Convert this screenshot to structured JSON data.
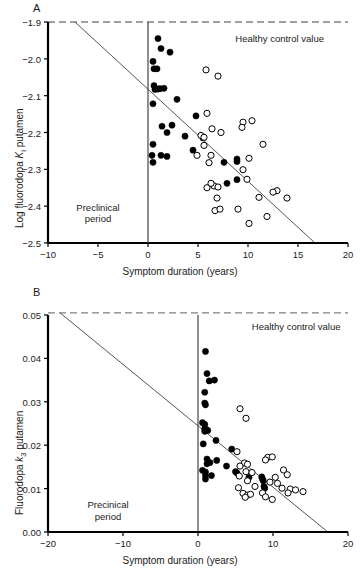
{
  "figure": {
    "xlabel": "Symptom duration (years)"
  },
  "chart_data": [
    {
      "id": "panel-a",
      "type": "scatter",
      "panel_label": "A",
      "title": "",
      "xlabel": "Symptom duration (years)",
      "ylabel": "Log fluorodopa Ki putamen",
      "ylabel_prefix": "Log fluorodopa ",
      "ylabel_symbol": "K",
      "ylabel_sub": "i",
      "ylabel_suffix": " putamen",
      "xlim": [
        -10,
        20
      ],
      "ylim": [
        -2.5,
        -1.9
      ],
      "xticks": [
        -10,
        -5,
        0,
        5,
        10,
        15,
        20
      ],
      "xticklabels": [
        "−10",
        "−5",
        "0",
        "5",
        "10",
        "15",
        "20"
      ],
      "yticks": [
        -2.5,
        -2.4,
        -2.3,
        -2.2,
        -2.1,
        -2.0,
        -1.9
      ],
      "yticklabels": [
        "−2.5",
        "−2.4",
        "−2.3",
        "−2.2",
        "−2.1",
        "−2.0",
        "−1.9"
      ],
      "grid": false,
      "legend_position": "none",
      "annotations": [
        {
          "name": "healthy-control-label",
          "text": "Healthy control value",
          "x": 17.6,
          "y": -1.945,
          "anchor": "end"
        },
        {
          "name": "preclinical-label-line1",
          "text": "Preclinical",
          "x": -5.0,
          "y": -2.405,
          "anchor": "middle"
        },
        {
          "name": "preclinical-label-line2",
          "text": "period",
          "x": -5.0,
          "y": -2.435,
          "anchor": "middle"
        }
      ],
      "reference_line": {
        "name": "healthy-control-line",
        "y": -1.9,
        "style": "dashed",
        "color": "#808080"
      },
      "vertical_line": {
        "name": "symptom-onset-line",
        "x": 0,
        "style": "solid",
        "color": "#333333"
      },
      "regression_line": {
        "name": "regression-line",
        "x1": -7.3,
        "y1": -1.9,
        "x2": 16.7,
        "y2": -2.5,
        "color": "#555555"
      },
      "series": [
        {
          "name": "Patients (filled)",
          "marker": "filled-circle",
          "color": "#000000",
          "points": [
            [
              1.0,
              -1.945
            ],
            [
              1.3,
              -1.972
            ],
            [
              2.2,
              -1.982
            ],
            [
              0.5,
              -2.007
            ],
            [
              0.6,
              -2.027
            ],
            [
              0.9,
              -2.027
            ],
            [
              0.6,
              -2.073
            ],
            [
              0.7,
              -2.083
            ],
            [
              1.0,
              -2.082
            ],
            [
              1.2,
              -2.081
            ],
            [
              1.6,
              -2.08
            ],
            [
              0.5,
              -2.122
            ],
            [
              2.9,
              -2.11
            ],
            [
              1.4,
              -2.183
            ],
            [
              2.4,
              -2.18
            ],
            [
              4.8,
              -2.155
            ],
            [
              1.9,
              -2.2
            ],
            [
              3.7,
              -2.21
            ],
            [
              0.5,
              -2.232
            ],
            [
              5.5,
              -2.215
            ],
            [
              0.4,
              -2.262
            ],
            [
              1.3,
              -2.262
            ],
            [
              1.9,
              -2.265
            ],
            [
              4.5,
              -2.248
            ],
            [
              0.5,
              -2.281
            ],
            [
              7.6,
              -2.281
            ],
            [
              8.9,
              -2.272
            ],
            [
              8.9,
              -2.279
            ],
            [
              7.9,
              -2.338
            ],
            [
              8.9,
              -2.328
            ]
          ]
        },
        {
          "name": "Patients (open)",
          "marker": "open-circle",
          "color": "#000000",
          "points": [
            [
              5.8,
              -2.03
            ],
            [
              7.0,
              -2.047
            ],
            [
              5.9,
              -2.148
            ],
            [
              9.5,
              -2.172
            ],
            [
              10.4,
              -2.168
            ],
            [
              6.4,
              -2.19
            ],
            [
              7.3,
              -2.2
            ],
            [
              9.4,
              -2.186
            ],
            [
              5.3,
              -2.208
            ],
            [
              5.6,
              -2.213
            ],
            [
              5.6,
              -2.235
            ],
            [
              11.5,
              -2.232
            ],
            [
              4.9,
              -2.262
            ],
            [
              6.3,
              -2.262
            ],
            [
              10.1,
              -2.27
            ],
            [
              6.1,
              -2.282
            ],
            [
              9.5,
              -2.301
            ],
            [
              5.9,
              -2.35
            ],
            [
              6.6,
              -2.345
            ],
            [
              7.0,
              -2.348
            ],
            [
              9.9,
              -2.327
            ],
            [
              6.3,
              -2.338
            ],
            [
              12.9,
              -2.358
            ],
            [
              13.9,
              -2.378
            ],
            [
              6.9,
              -2.378
            ],
            [
              11.1,
              -2.376
            ],
            [
              12.5,
              -2.362
            ],
            [
              6.7,
              -2.412
            ],
            [
              7.2,
              -2.408
            ],
            [
              9.0,
              -2.408
            ],
            [
              11.9,
              -2.428
            ],
            [
              10.1,
              -2.447
            ]
          ]
        }
      ]
    },
    {
      "id": "panel-b",
      "type": "scatter",
      "panel_label": "B",
      "title": "",
      "xlabel": "Symptom duration (years)",
      "ylabel": "Fluorodopa k3 putamen",
      "ylabel_prefix": "Fluorodopa ",
      "ylabel_symbol": "k",
      "ylabel_sub": "3",
      "ylabel_suffix": " putamen",
      "xlim": [
        -20,
        20
      ],
      "ylim": [
        0.0,
        0.05
      ],
      "xticks": [
        -20,
        -10,
        0,
        10,
        20
      ],
      "xticklabels": [
        "−20",
        "−10",
        "0",
        "10",
        "20"
      ],
      "yticks": [
        0.0,
        0.01,
        0.02,
        0.03,
        0.04,
        0.05
      ],
      "yticklabels": [
        "0.00",
        "0.01",
        "0.02",
        "0.03",
        "0.04",
        "0.05"
      ],
      "grid": false,
      "legend_position": "none",
      "annotations": [
        {
          "name": "healthy-control-label",
          "text": "Healthy control value",
          "x": 19.0,
          "y": 0.0472,
          "anchor": "end"
        },
        {
          "name": "preclinical-label-line1",
          "text": "Precinical",
          "x": -12.0,
          "y": 0.0062,
          "anchor": "middle"
        },
        {
          "name": "preclinical-label-line2",
          "text": "period",
          "x": -12.0,
          "y": 0.0035,
          "anchor": "middle"
        }
      ],
      "reference_line": {
        "name": "healthy-control-line",
        "y": 0.0505,
        "style": "dashed",
        "color": "#808080"
      },
      "vertical_line": {
        "name": "symptom-onset-line",
        "x": 0,
        "style": "solid",
        "color": "#333333"
      },
      "regression_line": {
        "name": "regression-line",
        "x1": -18.4,
        "y1": 0.0505,
        "x2": 17.3,
        "y2": 0.0,
        "color": "#555555"
      },
      "series": [
        {
          "name": "Patients (filled)",
          "marker": "filled-circle",
          "color": "#000000",
          "points": [
            [
              1.0,
              0.0416
            ],
            [
              1.2,
              0.0365
            ],
            [
              2.2,
              0.035
            ],
            [
              1.5,
              0.0348
            ],
            [
              0.9,
              0.0322
            ],
            [
              0.9,
              0.0297
            ],
            [
              1.0,
              0.0293
            ],
            [
              0.6,
              0.0252
            ],
            [
              0.9,
              0.0248
            ],
            [
              0.9,
              0.0238
            ],
            [
              1.1,
              0.0236
            ],
            [
              1.3,
              0.0234
            ],
            [
              0.9,
              0.0232
            ],
            [
              2.4,
              0.0211
            ],
            [
              0.7,
              0.0203
            ],
            [
              4.5,
              0.0191
            ],
            [
              1.2,
              0.0168
            ],
            [
              2.5,
              0.0165
            ],
            [
              1.6,
              0.016
            ],
            [
              1.2,
              0.0157
            ],
            [
              3.8,
              0.0152
            ],
            [
              0.6,
              0.0142
            ],
            [
              1.0,
              0.0138
            ],
            [
              5.0,
              0.0139
            ],
            [
              5.2,
              0.0136
            ],
            [
              1.0,
              0.013
            ],
            [
              1.8,
              0.013
            ],
            [
              6.8,
              0.0126
            ],
            [
              1.0,
              0.0122
            ],
            [
              8.5,
              0.0127
            ],
            [
              8.6,
              0.0122
            ],
            [
              8.7,
              0.0118
            ],
            [
              8.8,
              0.0105
            ],
            [
              8.9,
              0.0101
            ]
          ]
        },
        {
          "name": "Patients (open)",
          "marker": "open-circle",
          "color": "#000000",
          "points": [
            [
              5.6,
              0.0284
            ],
            [
              6.4,
              0.0262
            ],
            [
              5.2,
              0.0185
            ],
            [
              9.3,
              0.0172
            ],
            [
              9.9,
              0.0173
            ],
            [
              9.0,
              0.0166
            ],
            [
              6.2,
              0.0159
            ],
            [
              6.6,
              0.0156
            ],
            [
              5.6,
              0.0152
            ],
            [
              11.4,
              0.0143
            ],
            [
              6.4,
              0.0139
            ],
            [
              7.2,
              0.0137
            ],
            [
              11.9,
              0.0132
            ],
            [
              5.5,
              0.0129
            ],
            [
              10.3,
              0.0126
            ],
            [
              6.6,
              0.0118
            ],
            [
              9.6,
              0.0115
            ],
            [
              10.6,
              0.0112
            ],
            [
              5.4,
              0.0102
            ],
            [
              7.6,
              0.0105
            ],
            [
              11.2,
              0.0101
            ],
            [
              12.3,
              0.0099
            ],
            [
              13.0,
              0.0097
            ],
            [
              14.0,
              0.0093
            ],
            [
              6.0,
              0.0089
            ],
            [
              6.6,
              0.0085
            ],
            [
              7.0,
              0.0087
            ],
            [
              8.6,
              0.009
            ],
            [
              9.0,
              0.0081
            ],
            [
              12.0,
              0.009
            ],
            [
              6.3,
              0.008
            ],
            [
              9.9,
              0.0075
            ]
          ]
        }
      ]
    }
  ]
}
